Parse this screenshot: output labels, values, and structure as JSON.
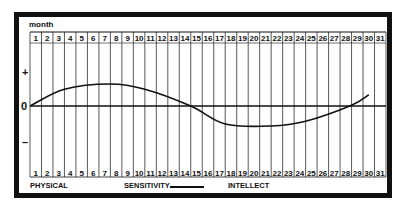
{
  "header": {
    "month_label": "month"
  },
  "axis": {
    "plus": "+",
    "zero": "0",
    "minus": "–"
  },
  "legend": {
    "physical": "PHYSICAL",
    "sensitivity": "SENSITIVITY",
    "intellect": "INTELLECT"
  },
  "colors": {
    "ink": "#111111",
    "background": "#ffffff"
  },
  "chart_data": {
    "type": "line",
    "title": "",
    "xlabel": "month",
    "ylabel": "",
    "x_ticks": [
      1,
      2,
      3,
      4,
      5,
      6,
      7,
      8,
      9,
      10,
      11,
      12,
      13,
      14,
      15,
      16,
      17,
      18,
      19,
      20,
      21,
      22,
      23,
      24,
      25,
      26,
      27,
      28,
      29,
      30,
      31
    ],
    "y_ticks": [
      "+",
      "0",
      "–"
    ],
    "xlim": [
      1,
      31
    ],
    "ylim": [
      -1,
      1
    ],
    "grid": "vertical lines per day",
    "legend": [
      "PHYSICAL",
      "SENSITIVITY",
      "INTELLECT"
    ],
    "legend_position": "bottom",
    "series": [
      {
        "name": "SENSITIVITY",
        "x": [
          1,
          4,
          8,
          11,
          15,
          18,
          22,
          25,
          29,
          30.5
        ],
        "values": [
          0,
          0.42,
          0.55,
          0.42,
          0.0,
          -0.45,
          -0.5,
          -0.38,
          0.02,
          0.28
        ]
      }
    ]
  }
}
